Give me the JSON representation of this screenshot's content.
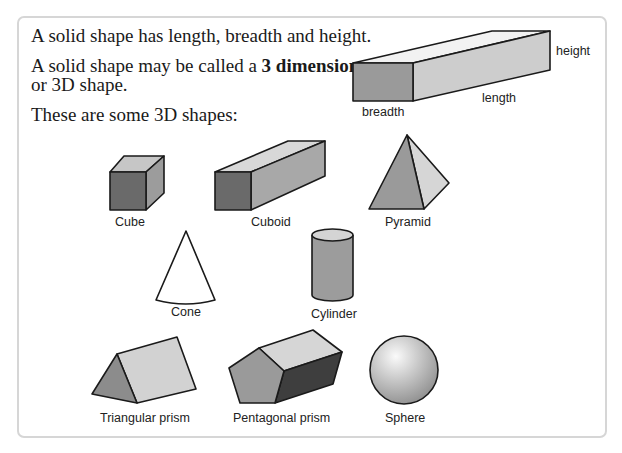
{
  "text": {
    "line1": "A solid shape has length, breadth and height.",
    "line2_prefix": "A solid shape may be called a ",
    "line2_bold": "3 dimensional",
    "line3": "or 3D shape.",
    "line4": "These are some 3D shapes:"
  },
  "diagram": {
    "labels": {
      "height": "height",
      "length": "length",
      "breadth": "breadth"
    }
  },
  "shapes": [
    {
      "name": "Cube"
    },
    {
      "name": "Cuboid"
    },
    {
      "name": "Pyramid"
    },
    {
      "name": "Cone"
    },
    {
      "name": "Cylinder"
    },
    {
      "name": "Triangular prism"
    },
    {
      "name": "Pentagonal prism"
    },
    {
      "name": "Sphere"
    }
  ],
  "colors": {
    "dark_face": "#6e6e6e",
    "mid_face": "#9c9c9c",
    "light_face": "#c8c8c8",
    "lightest_face": "#dedede",
    "outline": "#1a1a1a",
    "panel_border": "#d6d6d6"
  }
}
